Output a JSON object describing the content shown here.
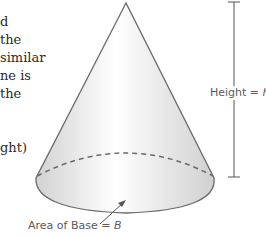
{
  "left_text_fragments": [
    {
      "text": "d",
      "x": 0,
      "y": 18
    },
    {
      "text": "the",
      "x": 0,
      "y": 36
    },
    {
      "text": "similar",
      "x": 0,
      "y": 54
    },
    {
      "text": "ne is",
      "x": 0,
      "y": 72
    },
    {
      "text": "the",
      "x": 0,
      "y": 90
    },
    {
      "text": "ght)",
      "x": 0,
      "y": 144
    }
  ],
  "diagram": {
    "shape": "cone",
    "height_label": {
      "prefix": "Height = ",
      "var": "h"
    },
    "base_label": {
      "prefix": "Area of Base = ",
      "var": "B"
    },
    "colors": {
      "outline": "#6a6a6a",
      "fill_light": "#ffffff",
      "fill_dark": "#d6d6d6",
      "dash": "#6a6a6a",
      "arrow": "#555555"
    }
  }
}
